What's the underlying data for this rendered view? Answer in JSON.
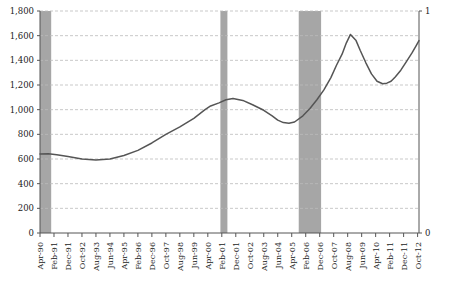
{
  "chart_data": {
    "type": "line",
    "title": "",
    "xlabel": "",
    "ylabel": "",
    "ylim": [
      0,
      1800
    ],
    "y2lim": [
      0,
      1
    ],
    "grid": true,
    "legend": null,
    "line_color": "#555555",
    "band_color": "#a6a6a6",
    "axis_color": "#555555",
    "grid_color": "#bbbbbb",
    "yticks": [
      "0",
      "200",
      "400",
      "600",
      "800",
      "1,000",
      "1,200",
      "1,400",
      "1,600",
      "1,800"
    ],
    "ytick_values": [
      0,
      200,
      400,
      600,
      800,
      1000,
      1200,
      1400,
      1600,
      1800
    ],
    "y2ticks": [
      "0",
      "1"
    ],
    "y2tick_values": [
      0,
      1
    ],
    "categories": [
      "Apr-90",
      "Feb-91",
      "Dec-91",
      "Oct-92",
      "Aug-93",
      "Jun-94",
      "Apr-95",
      "Feb-96",
      "Dec-96",
      "Oct-97",
      "Aug-98",
      "Jun-99",
      "Apr-00",
      "Feb-01",
      "Dec-01",
      "Oct-02",
      "Aug-03",
      "Jun-04",
      "Apr-05",
      "Feb-06",
      "Dec-06",
      "Oct-07",
      "Aug-08",
      "Jun-09",
      "Apr-10",
      "Feb-11",
      "Dec-11",
      "Oct-12"
    ],
    "x": [
      0,
      10,
      20,
      30,
      40,
      50,
      60,
      70,
      80,
      90,
      100,
      110,
      120,
      130,
      140,
      150,
      160,
      170,
      180,
      190,
      200,
      210,
      220,
      230,
      240,
      250,
      260,
      270
    ],
    "series": [
      {
        "name": "Index",
        "values": [
          640,
          642,
          635,
          620,
          600,
          592,
          600,
          628,
          670,
          730,
          800,
          860,
          930,
          1000,
          1030,
          1055,
          1080,
          1090,
          1075,
          1040,
          995,
          950,
          915,
          895,
          890,
          900,
          950,
          1010,
          1080,
          1160,
          1260,
          1360,
          1450,
          1540,
          1610,
          1560,
          1480,
          1380,
          1290,
          1230,
          1210,
          1215,
          1230,
          1265,
          1320,
          1390,
          1460,
          1520,
          1560
        ],
        "x": [
          0,
          6,
          12,
          20,
          30,
          40,
          50,
          60,
          70,
          80,
          90,
          100,
          110,
          118,
          122,
          128,
          133,
          138,
          145,
          152,
          160,
          166,
          170,
          174,
          178,
          182,
          188,
          193,
          198,
          203,
          208,
          212,
          216,
          219,
          222,
          226,
          229,
          233,
          237,
          241,
          245,
          248,
          251,
          254,
          258,
          262,
          266,
          269,
          271
        ]
      }
    ],
    "recession_bands": [
      {
        "label": "Jul-90 to Mar-91",
        "x0": 0,
        "x1": 8
      },
      {
        "label": "Mar-01 to Nov-01",
        "x0": 129,
        "x1": 134
      },
      {
        "label": "Dec-07 to Jun-09",
        "x0": 185,
        "x1": 201
      }
    ]
  }
}
